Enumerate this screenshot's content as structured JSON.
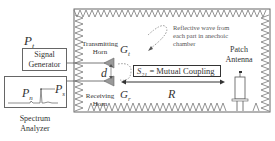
{
  "left_panel": {
    "pt_label": "P",
    "pt_sub": "t",
    "signal_generator": "Signal Generator",
    "spectrum_analyzer": "Spectrum Analyzer",
    "pn_label": "P",
    "pn_sub": "n",
    "ps_label": "P",
    "ps_sub": "s"
  },
  "chamber": {
    "transmitting_horn": "Transmitting Horn",
    "receiving_horn": "Receiving Horn",
    "gt_label": "G",
    "gt_sub": "t",
    "gr_label": "G",
    "gr_sub": "r",
    "d_label": "d",
    "reflective_note": "Reflective wave from each part in anechoic chamber",
    "s21_label": "S",
    "s21_sub": "21",
    "s21_text": " = Mutual Coupling",
    "r_label": "R",
    "patch_antenna": "Patch Antenna"
  },
  "colors": {
    "line": "#555555",
    "absorber": "#777777",
    "horn_fill": "#999999"
  }
}
